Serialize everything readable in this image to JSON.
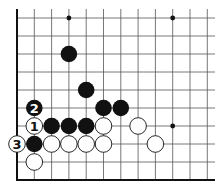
{
  "diagram": {
    "type": "go-board-fragment",
    "colors": {
      "background": "#ffffff",
      "line": "#555555",
      "edge": "#111111",
      "black": "#111111",
      "white": "#ffffff"
    },
    "grid": {
      "cols": 12,
      "rows": 10,
      "x0": 17,
      "dx": 17.3,
      "y0": 18,
      "dy": 18,
      "line_top_extend": 9,
      "line_right_extend": 215,
      "left_edge": true,
      "bottom_edge": true
    },
    "star_points": [
      {
        "col": 3,
        "row": 0
      },
      {
        "col": 9,
        "row": 0
      },
      {
        "col": 9,
        "row": 6
      }
    ],
    "stones": [
      {
        "col": 3,
        "row": 2,
        "color": "black",
        "label": ""
      },
      {
        "col": 4,
        "row": 4,
        "color": "black",
        "label": ""
      },
      {
        "col": 1,
        "row": 5,
        "color": "black",
        "label": "2"
      },
      {
        "col": 5,
        "row": 5,
        "color": "black",
        "label": ""
      },
      {
        "col": 6,
        "row": 5,
        "color": "black",
        "label": ""
      },
      {
        "col": 1,
        "row": 6,
        "color": "white",
        "label": "1"
      },
      {
        "col": 2,
        "row": 6,
        "color": "black",
        "label": ""
      },
      {
        "col": 3,
        "row": 6,
        "color": "black",
        "label": ""
      },
      {
        "col": 4,
        "row": 6,
        "color": "black",
        "label": ""
      },
      {
        "col": 5,
        "row": 6,
        "color": "white",
        "label": ""
      },
      {
        "col": 7,
        "row": 6,
        "color": "white",
        "label": ""
      },
      {
        "col": 0,
        "row": 7,
        "color": "white",
        "label": "3"
      },
      {
        "col": 1,
        "row": 7,
        "color": "black",
        "label": ""
      },
      {
        "col": 2,
        "row": 7,
        "color": "white",
        "label": ""
      },
      {
        "col": 3,
        "row": 7,
        "color": "white",
        "label": ""
      },
      {
        "col": 4,
        "row": 7,
        "color": "white",
        "label": ""
      },
      {
        "col": 5,
        "row": 7,
        "color": "white",
        "label": ""
      },
      {
        "col": 8,
        "row": 7,
        "color": "white",
        "label": ""
      },
      {
        "col": 1,
        "row": 8,
        "color": "white",
        "label": ""
      }
    ]
  }
}
